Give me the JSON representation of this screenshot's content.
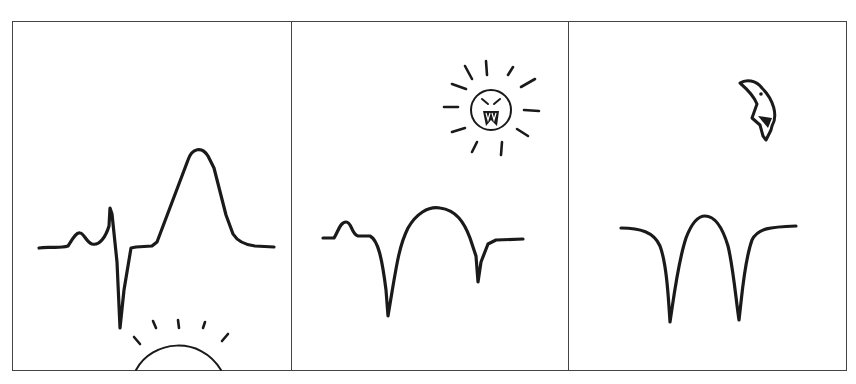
{
  "comic": {
    "panel_count": 3,
    "colors": {
      "ink": "#1a1a1a",
      "frame": "#444444",
      "background": "#ffffff"
    },
    "panels": [
      {
        "id": 1,
        "celestial": "rising-sun",
        "waveform": "normal ecg with tall upright t-wave"
      },
      {
        "id": 2,
        "celestial": "angry-sun-face",
        "waveform": "inverted deep q-waves with dome"
      },
      {
        "id": 3,
        "celestial": "crescent-moon-face",
        "waveform": "w-shaped double deep trough"
      }
    ]
  }
}
